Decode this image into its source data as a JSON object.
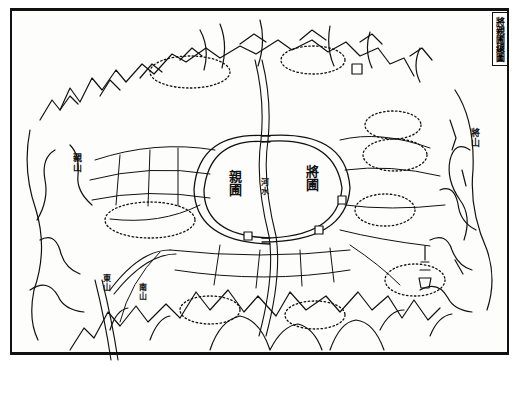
{
  "title": "將親圃總圖",
  "labels": {
    "left_garden": "親圃",
    "right_garden": "將圃",
    "center_channel": "河水",
    "left_mountain": "親山",
    "right_mountain": "將山",
    "bottom_left_mountain_a": "東山",
    "bottom_left_mountain_b": "南山",
    "plot_label": "田"
  },
  "colors": {
    "ink": "#111111",
    "paper": "#fdfdfb"
  }
}
